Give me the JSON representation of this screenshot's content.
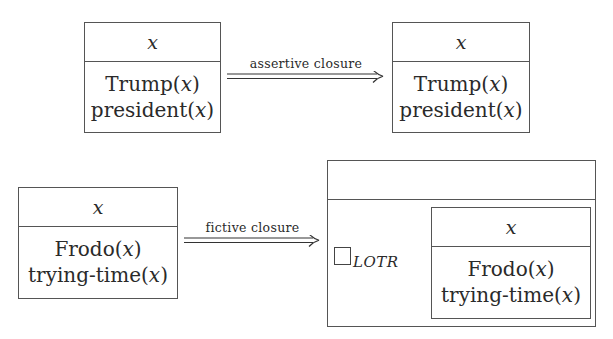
{
  "diagram": {
    "type": "DRS closure transformations",
    "rows": [
      {
        "source_drs": {
          "universe": "x",
          "conditions": [
            {
              "pred": "Trump",
              "arg": "x"
            },
            {
              "pred": "president",
              "arg": "x"
            }
          ]
        },
        "arrow": {
          "label": "assertive closure",
          "style": "double-arrow"
        },
        "target_drs": {
          "universe": "x",
          "conditions": [
            {
              "pred": "Trump",
              "arg": "x"
            },
            {
              "pred": "president",
              "arg": "x"
            }
          ]
        }
      },
      {
        "source_drs": {
          "universe": "x",
          "conditions": [
            {
              "pred": "Frodo",
              "arg": "x"
            },
            {
              "pred": "trying-time",
              "arg": "x"
            }
          ]
        },
        "arrow": {
          "label": "fictive closure",
          "style": "double-arrow"
        },
        "target_drs": {
          "universe": "",
          "operator": {
            "symbol": "box",
            "subscript": "LOTR"
          },
          "embedded_drs": {
            "universe": "x",
            "conditions": [
              {
                "pred": "Frodo",
                "arg": "x"
              },
              {
                "pred": "trying-time",
                "arg": "x"
              }
            ]
          }
        }
      }
    ]
  }
}
